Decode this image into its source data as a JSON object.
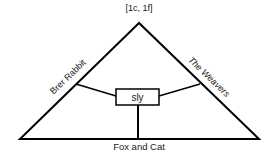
{
  "diagram": {
    "header": "[1c, 1f]",
    "center_label": "sly",
    "left_side_label": "Brer Rabbit",
    "right_side_label": "The Weavers",
    "bottom_label": "Fox and Cat",
    "line_color": "#000000",
    "text_color": "#1a1a1a"
  }
}
